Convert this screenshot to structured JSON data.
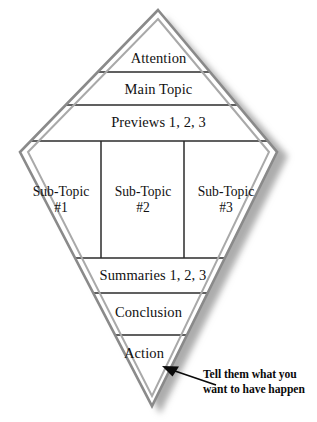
{
  "diagram": {
    "type": "kite-diamond-framework",
    "title_visible": false,
    "shape_name": "presentation-structure-diamond",
    "colors": {
      "border_outer": "#8c8c8c",
      "border_inner": "#b0b0b0",
      "divider": "#2b2b2b",
      "text": "#111111",
      "shadow": "#9a9a9a",
      "background": "#ffffff"
    },
    "bands": [
      {
        "id": "attention",
        "label": "Attention"
      },
      {
        "id": "main-topic",
        "label": "Main Topic"
      },
      {
        "id": "previews",
        "label": "Previews 1, 2, 3"
      },
      {
        "id": "summaries",
        "label": "Summaries 1, 2, 3"
      },
      {
        "id": "conclusion",
        "label": "Conclusion"
      },
      {
        "id": "action",
        "label": "Action"
      }
    ],
    "subtopics": [
      {
        "id": "sub-topic-1",
        "label": "Sub-Topic",
        "number": "#1"
      },
      {
        "id": "sub-topic-2",
        "label": "Sub-Topic",
        "number": "#2"
      },
      {
        "id": "sub-topic-3",
        "label": "Sub-Topic",
        "number": "#3"
      }
    ],
    "callout": {
      "line1": "Tell them what you",
      "line2": "want to have happen",
      "points_to": "action",
      "arrow": "solid-arrowhead-up-left"
    }
  }
}
